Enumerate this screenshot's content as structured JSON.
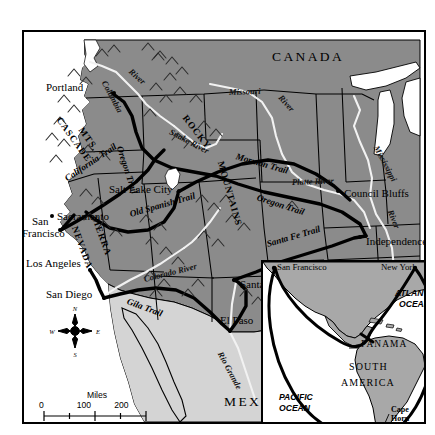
{
  "map": {
    "title": "Western Overland Trails to California and Oregon",
    "countries": [
      {
        "name": "CANADA",
        "x": 248,
        "y": 22
      },
      {
        "name": "MEXICO",
        "x": 200,
        "y": 367
      }
    ],
    "cities": [
      {
        "name": "Portland",
        "lx": 22,
        "ly": 56,
        "dx": 88,
        "dy": 61,
        "anchor": "right"
      },
      {
        "name": "Salt Lake City",
        "lx": 85,
        "ly": 158,
        "dx": 154,
        "dy": 160,
        "anchor": "left"
      },
      {
        "name": "Sacramento",
        "lx": 33,
        "ly": 185,
        "dx": 50,
        "dy": 183,
        "anchor": "left"
      },
      {
        "name": "San",
        "lx": 16,
        "ly": 190,
        "dx": null,
        "dy": null,
        "anchor": "right"
      },
      {
        "name": "Francisco",
        "lx": 2,
        "ly": 202,
        "dx": 37,
        "dy": 198,
        "anchor": "right"
      },
      {
        "name": "Los Angeles",
        "lx": 6,
        "ly": 232,
        "dx": 66,
        "dy": 238,
        "anchor": "right"
      },
      {
        "name": "San Diego",
        "lx": 28,
        "ly": 263,
        "dx": 80,
        "dy": 266,
        "anchor": "right"
      },
      {
        "name": "Santa Fe",
        "lx": 215,
        "ly": 252,
        "dx": 210,
        "dy": 248,
        "anchor": "left"
      },
      {
        "name": "El Paso",
        "lx": 193,
        "ly": 288,
        "dx": 206,
        "dy": 299,
        "anchor": "left"
      },
      {
        "name": "Council Bluffs",
        "lx": 318,
        "ly": 163,
        "dx": 314,
        "dy": 159,
        "anchor": "left"
      },
      {
        "name": "Independence",
        "lx": 340,
        "ly": 211,
        "dx": 336,
        "dy": 205,
        "anchor": "left"
      }
    ],
    "trails": [
      {
        "name": "Oregon Trail",
        "x": 95,
        "y": 110,
        "rot": 72
      },
      {
        "name": "California Trail",
        "x": 42,
        "y": 143,
        "rot": 34
      },
      {
        "name": "Old Spanish Trail",
        "x": 106,
        "y": 178,
        "rot": 16
      },
      {
        "name": "Mormon Trail",
        "x": 212,
        "y": 120,
        "rot": 16
      },
      {
        "name": "Oregon Trail",
        "x": 233,
        "y": 161,
        "rot": 18
      },
      {
        "name": "Santa Fe Trail",
        "x": 243,
        "y": 208,
        "rot": -16
      },
      {
        "name": "Gila Trail",
        "x": 103,
        "y": 265,
        "rot": 20
      }
    ],
    "rivers": [
      {
        "name": "Columbia",
        "x": 80,
        "y": 45,
        "rot": 62
      },
      {
        "name": "River",
        "x": 104,
        "y": 35,
        "rot": 40
      },
      {
        "name": "Snake River",
        "x": 148,
        "y": 97,
        "rot": 28
      },
      {
        "name": "Missouri",
        "x": 209,
        "y": 58,
        "rot": -2
      },
      {
        "name": "River",
        "x": 257,
        "y": 62,
        "rot": 48
      },
      {
        "name": "Platte River",
        "x": 272,
        "y": 148,
        "rot": -2
      },
      {
        "name": "Mississippi",
        "x": 355,
        "y": 113,
        "rot": 62
      },
      {
        "name": "River",
        "x": 368,
        "y": 176,
        "rot": 68
      },
      {
        "name": "Colorado River",
        "x": 120,
        "y": 243,
        "rot": -14
      },
      {
        "name": "Rio Grande",
        "x": 196,
        "y": 318,
        "rot": 62
      }
    ],
    "ranges": [
      {
        "name": "CASCADE",
        "x": 36,
        "y": 84,
        "rot": 54
      },
      {
        "name": "MTS.",
        "x": 56,
        "y": 92,
        "rot": 54
      },
      {
        "name": "ROCKY",
        "x": 160,
        "y": 83,
        "rot": 52
      },
      {
        "name": "MOUNTAINS",
        "x": 196,
        "y": 128,
        "rot": 74
      },
      {
        "name": "SIERRA",
        "x": 70,
        "y": 183,
        "rot": 70
      },
      {
        "name": "NEVADA",
        "x": 52,
        "y": 192,
        "rot": 70
      }
    ],
    "scale": {
      "miles_label": "Miles",
      "miles_ticks": [
        "0",
        "100",
        "200"
      ],
      "km_ticks": [
        "0",
        "200",
        "400"
      ],
      "km_label": "Kilometers"
    },
    "compass": {
      "n": "N",
      "e": "E",
      "s": "S",
      "w": "W"
    }
  },
  "inset": {
    "cities": [
      {
        "name": "San Francisco",
        "x": 12,
        "y": 4
      },
      {
        "name": "New York",
        "x": 118,
        "y": 4
      }
    ],
    "oceans": [
      {
        "name": "ATLANTIC",
        "x": 132,
        "y": 30
      },
      {
        "name": "OCEAN",
        "x": 135,
        "y": 41
      },
      {
        "name": "PACIFIC",
        "x": 18,
        "y": 133
      },
      {
        "name": "OCEAN",
        "x": 18,
        "y": 144
      }
    ],
    "places": [
      {
        "name": "PANAMA",
        "x": 92,
        "y": 82,
        "size": 9.4
      },
      {
        "name": "SOUTH",
        "x": 80,
        "y": 104,
        "size": 10.4
      },
      {
        "name": "AMERICA",
        "x": 74,
        "y": 120,
        "size": 10.4
      }
    ],
    "capes": [
      {
        "name": "Cape",
        "x": 128,
        "y": 148
      },
      {
        "name": "Horn",
        "x": 128,
        "y": 157
      }
    ]
  },
  "colors": {
    "land_us": "#8b8b8b",
    "land_light": "#d4d4d4",
    "water": "#ffffff",
    "outline": "#000000",
    "river": "#f2f2f2",
    "inset_land": "#a8a8a8"
  }
}
